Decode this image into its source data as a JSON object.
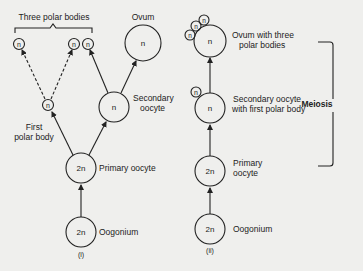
{
  "diagram_i": {
    "title": "Three polar bodies",
    "caption": "(i)",
    "nodes": {
      "oogonium": {
        "ploidy": "2n",
        "label": "Oogonium"
      },
      "primary_oocyte": {
        "ploidy": "2n",
        "label": "Primary oocyte"
      },
      "first_polar_body": {
        "ploidy": "n",
        "label_line1": "First",
        "label_line2": "polar body"
      },
      "secondary_oocyte": {
        "ploidy": "n",
        "label_line1": "Secondary",
        "label_line2": "oocyte"
      },
      "ovum": {
        "ploidy": "n",
        "label": "Ovum"
      },
      "polar_body_1": {
        "ploidy": "n"
      },
      "polar_body_2": {
        "ploidy": "n"
      },
      "polar_body_3": {
        "ploidy": "n"
      }
    }
  },
  "diagram_ii": {
    "caption": "(ii)",
    "bracket_label": "Meiosis",
    "nodes": {
      "oogonium": {
        "ploidy": "2n",
        "label": "Oogonium"
      },
      "primary_oocyte": {
        "ploidy": "2n",
        "label_line1": "Primary",
        "label_line2": "oocyte"
      },
      "secondary_oocyte": {
        "ploidy": "n",
        "polar_body": "n",
        "label_line1": "Secondary oocyte",
        "label_line2": "with first polar body"
      },
      "ovum": {
        "ploidy": "n",
        "polar_bodies": [
          "n",
          "n",
          "n"
        ],
        "label_line1": "Ovum with three",
        "label_line2": "polar bodies"
      }
    }
  }
}
